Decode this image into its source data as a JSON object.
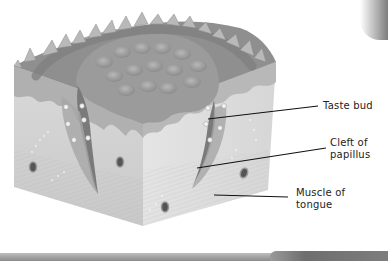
{
  "diagram": {
    "style": "grayscale illustration",
    "labels": [
      {
        "id": "taste-bud",
        "text": "Taste bud",
        "x": 323,
        "y": 101
      },
      {
        "id": "cleft-of-papillus",
        "text": "Cleft of\npapillus",
        "x": 330,
        "y": 138
      },
      {
        "id": "muscle-of-tongue",
        "text": "Muscle of\ntongue",
        "x": 296,
        "y": 187
      }
    ],
    "leader_lines": [
      {
        "to": "taste-bud",
        "x1": 208,
        "y1": 119,
        "x2": 318,
        "y2": 106
      },
      {
        "to": "cleft-of-papillus",
        "x1": 197,
        "y1": 168,
        "x2": 326,
        "y2": 148
      },
      {
        "to": "muscle-of-tongue",
        "x1": 214,
        "y1": 195,
        "x2": 288,
        "y2": 197
      }
    ],
    "colors": {
      "background": "#ffffff",
      "block_front": "#d4d4d4",
      "block_side": "#e2e2e2",
      "surface_dark": "#8c8c8c",
      "surface_mid": "#a3a3a3",
      "epithelium": "#b5b5b5",
      "line": "#111111",
      "text": "#222222"
    }
  }
}
